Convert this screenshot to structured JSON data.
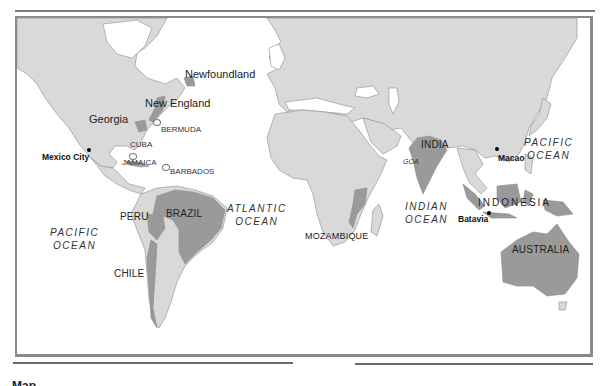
{
  "map": {
    "colors": {
      "land": "#d9d9d9",
      "highlight": "#9a9a9a",
      "water": "#ffffff",
      "border": "#8a8a8a",
      "coast": "#8c8c8c"
    },
    "regions": {
      "newfoundland": "Newfoundland",
      "new_england": "New England",
      "georgia": "Georgia"
    },
    "countries": {
      "india": "INDIA",
      "brazil": "BRAZIL",
      "peru": "PERU",
      "chile": "CHILE",
      "mozambique": "MOZAMBIQUE",
      "indonesia": "INDONESIA",
      "australia": "AUSTRALIA"
    },
    "islands": {
      "bermuda": "BERMUDA",
      "cuba": "CUBA",
      "jamaica": "JAMAICA",
      "barbados": "BARBADOS",
      "goa": "GOA"
    },
    "cities": {
      "mexico_city": "Mexico City",
      "macao": "Macao",
      "batavia": "Batavia"
    },
    "oceans": {
      "pacific_east": {
        "line1": "PACIFIC",
        "line2": "OCEAN"
      },
      "pacific_west": {
        "line1": "PACIFIC",
        "line2": "OCEAN"
      },
      "atlantic": {
        "line1": "ATLANTIC",
        "line2": "OCEAN"
      },
      "indian": {
        "line1": "INDIAN",
        "line2": "OCEAN"
      }
    }
  },
  "caption": {
    "text": "Map"
  }
}
